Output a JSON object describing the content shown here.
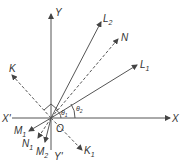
{
  "diagram": {
    "type": "vector-geometry",
    "origin_label": "O",
    "axes": {
      "x": "X",
      "x_neg": "X'",
      "y": "Y",
      "y_neg": "Y'"
    },
    "rays": [
      {
        "label": "L",
        "sub": "1",
        "style": "solid"
      },
      {
        "label": "L",
        "sub": "2",
        "style": "solid"
      },
      {
        "label": "N",
        "sub": "",
        "style": "dashed"
      },
      {
        "label": "K",
        "sub": "",
        "style": "dashed"
      },
      {
        "label": "K",
        "sub": "1",
        "style": "dashed"
      },
      {
        "label": "M",
        "sub": "1",
        "style": "solid"
      },
      {
        "label": "N",
        "sub": "1",
        "style": "dashed"
      },
      {
        "label": "M",
        "sub": "2",
        "style": "solid"
      }
    ],
    "angles": [
      {
        "label": "θ",
        "sub": "1"
      },
      {
        "label": "θ",
        "sub": "2"
      }
    ],
    "colors": {
      "line": "#444444",
      "text": "#333333"
    }
  }
}
